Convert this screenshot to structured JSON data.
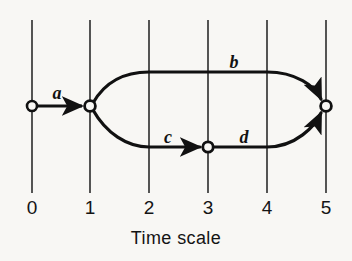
{
  "figure": {
    "title": "",
    "axis_title": "Time scale",
    "background_color": "#f8f7f4",
    "line_color": "#111111",
    "grid_line_color": "#2b2b2b"
  },
  "axis": {
    "label": "Time scale",
    "ticks": [
      {
        "value": "0",
        "x": 32
      },
      {
        "value": "1",
        "x": 90
      },
      {
        "value": "2",
        "x": 149
      },
      {
        "value": "3",
        "x": 208
      },
      {
        "value": "4",
        "x": 267
      },
      {
        "value": "5",
        "x": 326
      }
    ],
    "tick_label_y": 198,
    "grid_top": 20,
    "grid_bottom": 193
  },
  "nodes": [
    {
      "id": "n0",
      "label": "0",
      "x": 32,
      "y": 106,
      "time": 0
    },
    {
      "id": "n1",
      "label": "1",
      "x": 90,
      "y": 106,
      "time": 1
    },
    {
      "id": "n3",
      "label": "3",
      "x": 208,
      "y": 147,
      "time": 3
    },
    {
      "id": "n5",
      "label": "5",
      "x": 326,
      "y": 106,
      "time": 5
    }
  ],
  "edges": [
    {
      "id": "a",
      "label": "a",
      "from": "n0",
      "to": "n1",
      "label_x": 57,
      "label_y": 84,
      "start_time": 0,
      "end_time": 1
    },
    {
      "id": "b",
      "label": "b",
      "from": "n1",
      "to": "n5",
      "label_x": 234,
      "label_y": 53,
      "start_time": 1,
      "end_time": 5
    },
    {
      "id": "c",
      "label": "c",
      "from": "n1",
      "to": "n3",
      "label_x": 168,
      "label_y": 128,
      "start_time": 1,
      "end_time": 3
    },
    {
      "id": "d",
      "label": "d",
      "from": "n3",
      "to": "n5",
      "label_x": 244,
      "label_y": 128,
      "start_time": 3,
      "end_time": 5
    }
  ]
}
